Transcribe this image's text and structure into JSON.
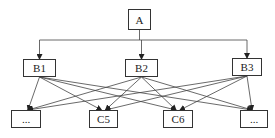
{
  "diagram": {
    "type": "hierarchy",
    "colors": {
      "line": "#444444",
      "box_border": "#333333",
      "text": "#222222",
      "background": "#ffffff"
    },
    "nodes": [
      {
        "id": "A",
        "label": "A",
        "level": 0,
        "x": 128,
        "y": 9,
        "w": 23,
        "h": 21
      },
      {
        "id": "B1",
        "label": "B1",
        "level": 1,
        "x": 23,
        "y": 59,
        "w": 33,
        "h": 18
      },
      {
        "id": "B2",
        "label": "B2",
        "level": 1,
        "x": 125,
        "y": 59,
        "w": 33,
        "h": 18
      },
      {
        "id": "B3",
        "label": "B3",
        "level": 1,
        "x": 232,
        "y": 58,
        "w": 30,
        "h": 18
      },
      {
        "id": "C1",
        "label": "...",
        "level": 2,
        "x": 11,
        "y": 110,
        "w": 30,
        "h": 18
      },
      {
        "id": "C5",
        "label": "C5",
        "level": 2,
        "x": 89,
        "y": 110,
        "w": 29,
        "h": 18
      },
      {
        "id": "C6",
        "label": "C6",
        "level": 2,
        "x": 163,
        "y": 110,
        "w": 30,
        "h": 18
      },
      {
        "id": "C4",
        "label": "...",
        "level": 2,
        "x": 240,
        "y": 110,
        "w": 28,
        "h": 18
      }
    ],
    "edges": [
      {
        "from": "A",
        "to": "B1"
      },
      {
        "from": "A",
        "to": "B2"
      },
      {
        "from": "A",
        "to": "B3"
      },
      {
        "from": "B1",
        "to": "C1"
      },
      {
        "from": "B1",
        "to": "C5"
      },
      {
        "from": "B1",
        "to": "C6"
      },
      {
        "from": "B1",
        "to": "C4"
      },
      {
        "from": "B2",
        "to": "C1"
      },
      {
        "from": "B2",
        "to": "C5"
      },
      {
        "from": "B2",
        "to": "C6"
      },
      {
        "from": "B2",
        "to": "C4"
      },
      {
        "from": "B3",
        "to": "C1"
      },
      {
        "from": "B3",
        "to": "C5"
      },
      {
        "from": "B3",
        "to": "C6"
      },
      {
        "from": "B3",
        "to": "C4"
      }
    ]
  }
}
